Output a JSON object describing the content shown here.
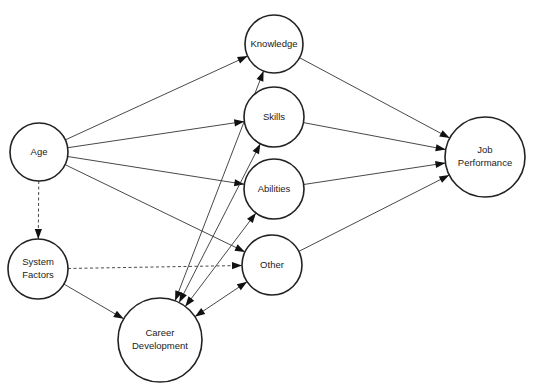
{
  "diagram": {
    "title": "",
    "nodes": [
      {
        "id": "age",
        "label": [
          "Age"
        ],
        "cx": 39,
        "cy": 152,
        "r": 29
      },
      {
        "id": "system-factors",
        "label": [
          "System",
          "Factors"
        ],
        "cx": 38,
        "cy": 269,
        "r": 30
      },
      {
        "id": "career-development",
        "label": [
          "Career",
          "Development"
        ],
        "cx": 160,
        "cy": 340,
        "r": 42
      },
      {
        "id": "knowledge",
        "label": [
          "Knowledge"
        ],
        "cx": 274,
        "cy": 44,
        "r": 29
      },
      {
        "id": "skills",
        "label": [
          "Skills"
        ],
        "cx": 274,
        "cy": 117,
        "r": 30
      },
      {
        "id": "abilities",
        "label": [
          "Abilities"
        ],
        "cx": 274,
        "cy": 189,
        "r": 30
      },
      {
        "id": "other",
        "label": [
          "Other"
        ],
        "cx": 272,
        "cy": 265,
        "r": 30
      },
      {
        "id": "job-performance",
        "label": [
          "Job",
          "Performance"
        ],
        "cx": 485,
        "cy": 157,
        "r": 40
      }
    ],
    "edges": [
      {
        "from": "age",
        "to": "knowledge",
        "style": "solid",
        "direction": "forward"
      },
      {
        "from": "age",
        "to": "skills",
        "style": "solid",
        "direction": "forward"
      },
      {
        "from": "age",
        "to": "abilities",
        "style": "solid",
        "direction": "forward"
      },
      {
        "from": "age",
        "to": "other",
        "style": "solid",
        "direction": "forward"
      },
      {
        "from": "age",
        "to": "system-factors",
        "style": "dashed",
        "direction": "forward"
      },
      {
        "from": "system-factors",
        "to": "other",
        "style": "dashed",
        "direction": "forward"
      },
      {
        "from": "system-factors",
        "to": "career-development",
        "style": "solid",
        "direction": "forward"
      },
      {
        "from": "knowledge",
        "to": "career-development",
        "style": "solid",
        "direction": "both"
      },
      {
        "from": "skills",
        "to": "career-development",
        "style": "solid",
        "direction": "both"
      },
      {
        "from": "abilities",
        "to": "career-development",
        "style": "solid",
        "direction": "both"
      },
      {
        "from": "other",
        "to": "career-development",
        "style": "solid",
        "direction": "both"
      },
      {
        "from": "knowledge",
        "to": "job-performance",
        "style": "solid",
        "direction": "forward"
      },
      {
        "from": "skills",
        "to": "job-performance",
        "style": "solid",
        "direction": "forward"
      },
      {
        "from": "abilities",
        "to": "job-performance",
        "style": "solid",
        "direction": "forward"
      },
      {
        "from": "other",
        "to": "job-performance",
        "style": "solid",
        "direction": "forward"
      }
    ],
    "colors": {
      "stroke": "#222222",
      "background": "#ffffff"
    }
  }
}
